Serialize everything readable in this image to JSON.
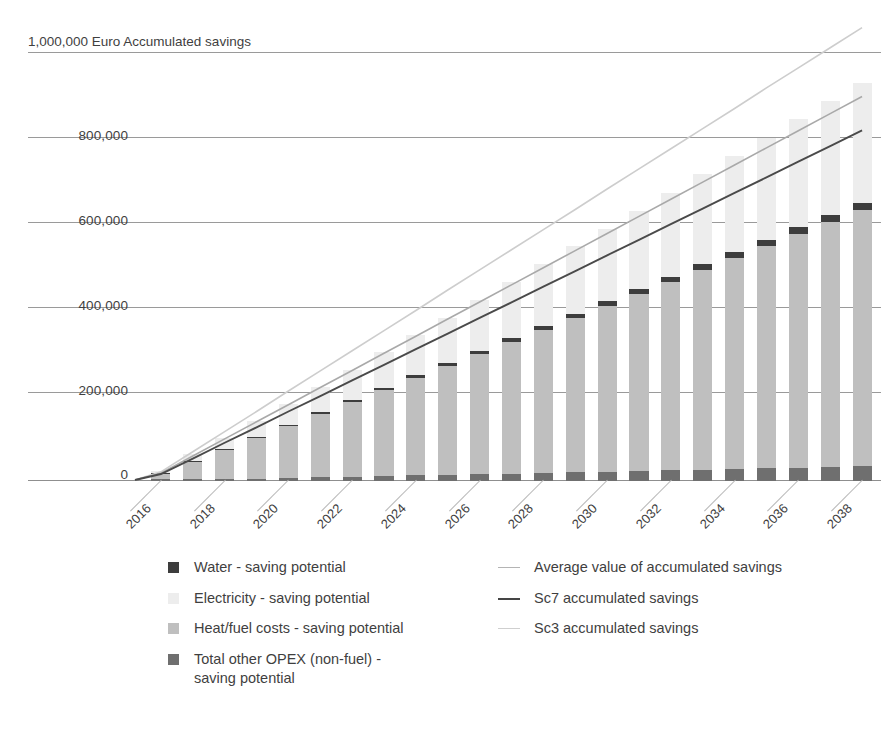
{
  "chart_data": {
    "type": "bar",
    "title": "1,000,000 Euro Accumulated savings",
    "xlabel": "",
    "ylabel": "Euro Accumulated savings",
    "ylim": [
      -60000,
      1000000
    ],
    "yticks": [
      0,
      200000,
      400000,
      600000,
      800000,
      1000000
    ],
    "ytick_labels": [
      "0",
      "200,000",
      "400,000",
      "600,000",
      "800,000",
      "1,000,000"
    ],
    "grid": true,
    "legend_position": "bottom",
    "categories": [
      "2016",
      "2017",
      "2018",
      "2019",
      "2020",
      "2021",
      "2022",
      "2023",
      "2024",
      "2025",
      "2026",
      "2027",
      "2028",
      "2029",
      "2030",
      "2031",
      "2032",
      "2033",
      "2034",
      "2035",
      "2036",
      "2037",
      "2038"
    ],
    "xtick_labels": [
      "2016",
      "2018",
      "2020",
      "2022",
      "2024",
      "2026",
      "2028",
      "2030",
      "2032",
      "2034",
      "2036",
      "2038"
    ],
    "series": [
      {
        "name": "Heat/fuel costs - saving potential",
        "kind": "bar",
        "color": "#bfbfbf",
        "values": [
          14000,
          42000,
          70000,
          98000,
          126000,
          154000,
          182000,
          210000,
          238000,
          266000,
          294000,
          322000,
          350000,
          378000,
          406000,
          434000,
          462000,
          490000,
          518000,
          546000,
          574000,
          602000,
          630000
        ]
      },
      {
        "name": "Electricity - saving potential",
        "kind": "bar",
        "color": "#ededed",
        "values": [
          5000,
          15000,
          25000,
          36000,
          47000,
          58000,
          70000,
          82000,
          94000,
          106000,
          118000,
          131000,
          144000,
          157000,
          170000,
          183000,
          196000,
          210000,
          224000,
          238000,
          252000,
          266000,
          280000
        ]
      },
      {
        "name": "Water - saving potential",
        "kind": "bar",
        "color": "#3d3d3d",
        "values": [
          400,
          1200,
          2000,
          2800,
          3600,
          4400,
          5200,
          6000,
          6800,
          7600,
          8400,
          9200,
          10000,
          10800,
          11600,
          12400,
          13200,
          14000,
          14800,
          15600,
          16400,
          17200,
          18000
        ]
      },
      {
        "name": "Total other OPEX (non-fuel) - saving potential",
        "kind": "bar",
        "color": "#6f6f6f",
        "values": [
          -1000,
          -2500,
          -4000,
          -5500,
          -7000,
          -8500,
          -10000,
          -11500,
          -13000,
          -14500,
          -16000,
          -17500,
          -19000,
          -20500,
          -22000,
          -23500,
          -25000,
          -26500,
          -28000,
          -29500,
          -31000,
          -32500,
          -34000
        ]
      },
      {
        "name": "Average value of accumulated savings",
        "kind": "line",
        "color": "#a9a9a9",
        "values": [
          16000,
          56000,
          96000,
          136000,
          176000,
          216000,
          256000,
          296000,
          336000,
          376000,
          416000,
          456000,
          496000,
          536000,
          576000,
          616000,
          656000,
          696000,
          736000,
          776000,
          816000,
          856000,
          896000
        ]
      },
      {
        "name": "Sc7 accumulated savings",
        "kind": "line",
        "color": "#454545",
        "values": [
          14000,
          50000,
          87000,
          123000,
          160000,
          196000,
          233000,
          269000,
          306000,
          342000,
          379000,
          415000,
          452000,
          488000,
          525000,
          561000,
          598000,
          634000,
          671000,
          707000,
          744000,
          780000,
          817000
        ]
      },
      {
        "name": "Sc3 accumulated savings",
        "kind": "line",
        "color": "#c9c9c9",
        "values": [
          19000,
          66000,
          113000,
          160000,
          208000,
          255000,
          302000,
          349000,
          396000,
          444000,
          491000,
          538000,
          585000,
          632000,
          680000,
          727000,
          774000,
          821000,
          868000,
          916000,
          963000,
          1010000,
          1057000
        ]
      }
    ]
  },
  "axis": {
    "title": "1,000,000 Euro Accumulated savings",
    "ytick_labels": [
      "1,000,000",
      "800,000",
      "600,000",
      "400,000",
      "200,000",
      "0"
    ]
  },
  "legend": {
    "bar_items": [
      {
        "label": "Water - saving potential",
        "color": "#3d3d3d"
      },
      {
        "label": "Electricity - saving potential",
        "color": "#ededed"
      },
      {
        "label": "Heat/fuel costs - saving potential",
        "color": "#bfbfbf"
      },
      {
        "label": "Total other OPEX (non-fuel) -\nsaving potential",
        "color": "#6f6f6f"
      }
    ],
    "line_items": [
      {
        "label": "Average value of accumulated savings",
        "color": "#b4b4b4",
        "weight": "1.5px"
      },
      {
        "label": "Sc7 accumulated savings",
        "color": "#454545",
        "weight": "2.5px"
      },
      {
        "label": "Sc3 accumulated savings",
        "color": "#cfcfcf",
        "weight": "1.5px"
      }
    ]
  }
}
